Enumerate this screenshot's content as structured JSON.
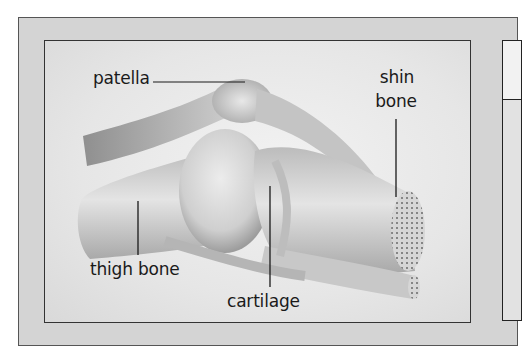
{
  "diagram": {
    "colors": {
      "outer_frame_bg": "#d4d4d4",
      "inner_bg": "#ebebeb",
      "line": "#1a1a1a",
      "bone": "#cfcfcf"
    },
    "labels": [
      {
        "id": "patella",
        "text": "patella"
      },
      {
        "id": "shin_bone_line1",
        "text": "shin"
      },
      {
        "id": "shin_bone_line2",
        "text": "bone"
      },
      {
        "id": "thigh_bone",
        "text": "thigh bone"
      },
      {
        "id": "cartilage",
        "text": "cartilage"
      }
    ]
  }
}
